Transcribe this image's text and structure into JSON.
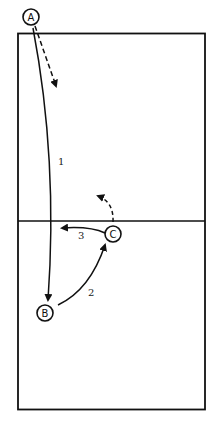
{
  "diagram": {
    "type": "volleyball court play diagram",
    "players": [
      {
        "id": "A",
        "label": "A"
      },
      {
        "id": "B",
        "label": "B"
      },
      {
        "id": "C",
        "label": "C"
      }
    ],
    "paths": [
      {
        "label": "1",
        "from": "A",
        "to": "B",
        "style": "solid"
      },
      {
        "label": "2",
        "from": "B",
        "to": "C",
        "style": "solid"
      },
      {
        "label": "3",
        "from": "C",
        "to": "left",
        "style": "solid"
      },
      {
        "label": "",
        "from": "A",
        "to": "court",
        "style": "dashed"
      },
      {
        "label": "",
        "from": "C",
        "to": "net-left",
        "style": "dashed"
      }
    ]
  },
  "colors": {
    "line": "#111111",
    "background": "#ffffff"
  }
}
